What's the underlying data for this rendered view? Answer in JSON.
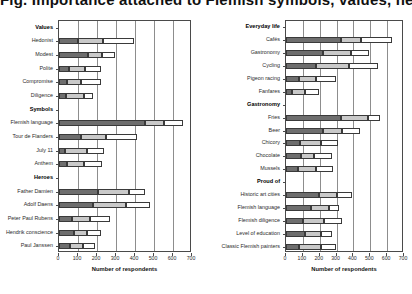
{
  "figure": {
    "title": "Fig. Importance attached to Flemish symbols, values, heroes and everyday-life elements",
    "xlabel": "Number of respondents",
    "legend_note": ""
  },
  "chart_data": {
    "type": "bar",
    "orientation": "horizontal",
    "stacked": true,
    "title": "Fig. Importance attached to Flemish symbols, values, heroes and everyday-life elements",
    "xlabel": "Number of respondents",
    "ylabel": "",
    "xlim": [
      0,
      700
    ],
    "xticks": [
      0,
      100,
      200,
      300,
      400,
      500,
      600,
      700
    ],
    "grid": true,
    "legend": [
      "Very important",
      "Important",
      "Somewhat important"
    ],
    "series_colors": [
      "#6e6e6e",
      "#c9c9c9",
      "#ffffff"
    ],
    "panels": [
      {
        "name": "left",
        "xlabel": "Number of respondents",
        "groups": [
          {
            "header": "Values",
            "categories": [
              "Hedonist",
              "Modest",
              "Polite",
              "Compromise",
              "Diligence"
            ],
            "series": [
              {
                "name": "Very important",
                "values": [
                  100,
                  150,
                  55,
                  40,
                  35
                ]
              },
              {
                "name": "Important",
                "values": [
                  130,
                  75,
                  80,
                  75,
                  95
                ]
              },
              {
                "name": "Somewhat important",
                "values": [
                  165,
                  70,
                  85,
                  105,
                  50
                ]
              }
            ],
            "totals": [
              395,
              295,
              220,
              220,
              180
            ]
          },
          {
            "header": "Symbols",
            "categories": [
              "Flemish language",
              "Tour de Flanders",
              "July 11",
              "Anthem"
            ],
            "series": [
              {
                "name": "Very important",
                "values": [
                  450,
                  115,
                  30,
                  40
                ]
              },
              {
                "name": "Important",
                "values": [
                  105,
                  135,
                  115,
                  90
                ]
              },
              {
                "name": "Somewhat important",
                "values": [
                  100,
                  160,
                  90,
                  95
                ]
              }
            ],
            "totals": [
              655,
              410,
              235,
              225
            ]
          },
          {
            "header": "Heroes",
            "categories": [
              "Father Damien",
              "Adolf Daens",
              "Peter Paul Rubens",
              "Hendrik conscience",
              "Paul Janssen"
            ],
            "series": [
              {
                "name": "Very important",
                "values": [
                  205,
                  180,
                  70,
                  80,
                  60
                ]
              },
              {
                "name": "Important",
                "values": [
                  165,
                  175,
                  95,
                  65,
                  65
                ]
              },
              {
                "name": "Somewhat important",
                "values": [
                  85,
                  125,
                  105,
                  75,
                  65
                ]
              }
            ],
            "totals": [
              455,
              480,
              270,
              220,
              190
            ]
          }
        ]
      },
      {
        "name": "right",
        "xlabel": "Number of respondents",
        "groups": [
          {
            "header": "Everyday life",
            "categories": [
              "Cafés",
              "Gastronomy",
              "Cycling",
              "Pigeon racing",
              "Fanfares"
            ],
            "series": [
              {
                "name": "Very important",
                "values": [
                  325,
                  220,
                  180,
                  75,
                  35
                ]
              },
              {
                "name": "Important",
                "values": [
                  120,
                  165,
                  195,
                  105,
                  80
                ]
              },
              {
                "name": "Somewhat important",
                "values": [
                  185,
                  105,
                  170,
                  115,
                  80
                ]
              }
            ],
            "totals": [
              630,
              490,
              545,
              295,
              195
            ]
          },
          {
            "header": "Gastronomy",
            "categories": [
              "Fries",
              "Beer",
              "Chicory",
              "Chocolate",
              "Mussels"
            ],
            "series": [
              {
                "name": "Very important",
                "values": [
                  325,
                  220,
                  85,
                  90,
                  70
                ]
              },
              {
                "name": "Important",
                "values": [
                  160,
                  115,
                  120,
                  75,
                  110
                ]
              },
              {
                "name": "Somewhat important",
                "values": [
                  75,
                  105,
                  105,
                  110,
                  100
                ]
              }
            ],
            "totals": [
              560,
              440,
              310,
              275,
              280
            ]
          },
          {
            "header": "Proud of",
            "categories": [
              "Historic art cities",
              "Flemish language",
              "Flemish diligence",
              "Level of education",
              "Classic Flemish painters"
            ],
            "series": [
              {
                "name": "Very important",
                "values": [
                  195,
                  150,
                  100,
                  110,
                  80
                ]
              },
              {
                "name": "Important",
                "values": [
                  105,
                  105,
                  125,
                  100,
                  130
                ]
              },
              {
                "name": "Somewhat important",
                "values": [
                  90,
                  60,
                  105,
                  65,
                  85
                ]
              }
            ],
            "totals": [
              390,
              315,
              330,
              275,
              295
            ]
          }
        ]
      }
    ]
  }
}
